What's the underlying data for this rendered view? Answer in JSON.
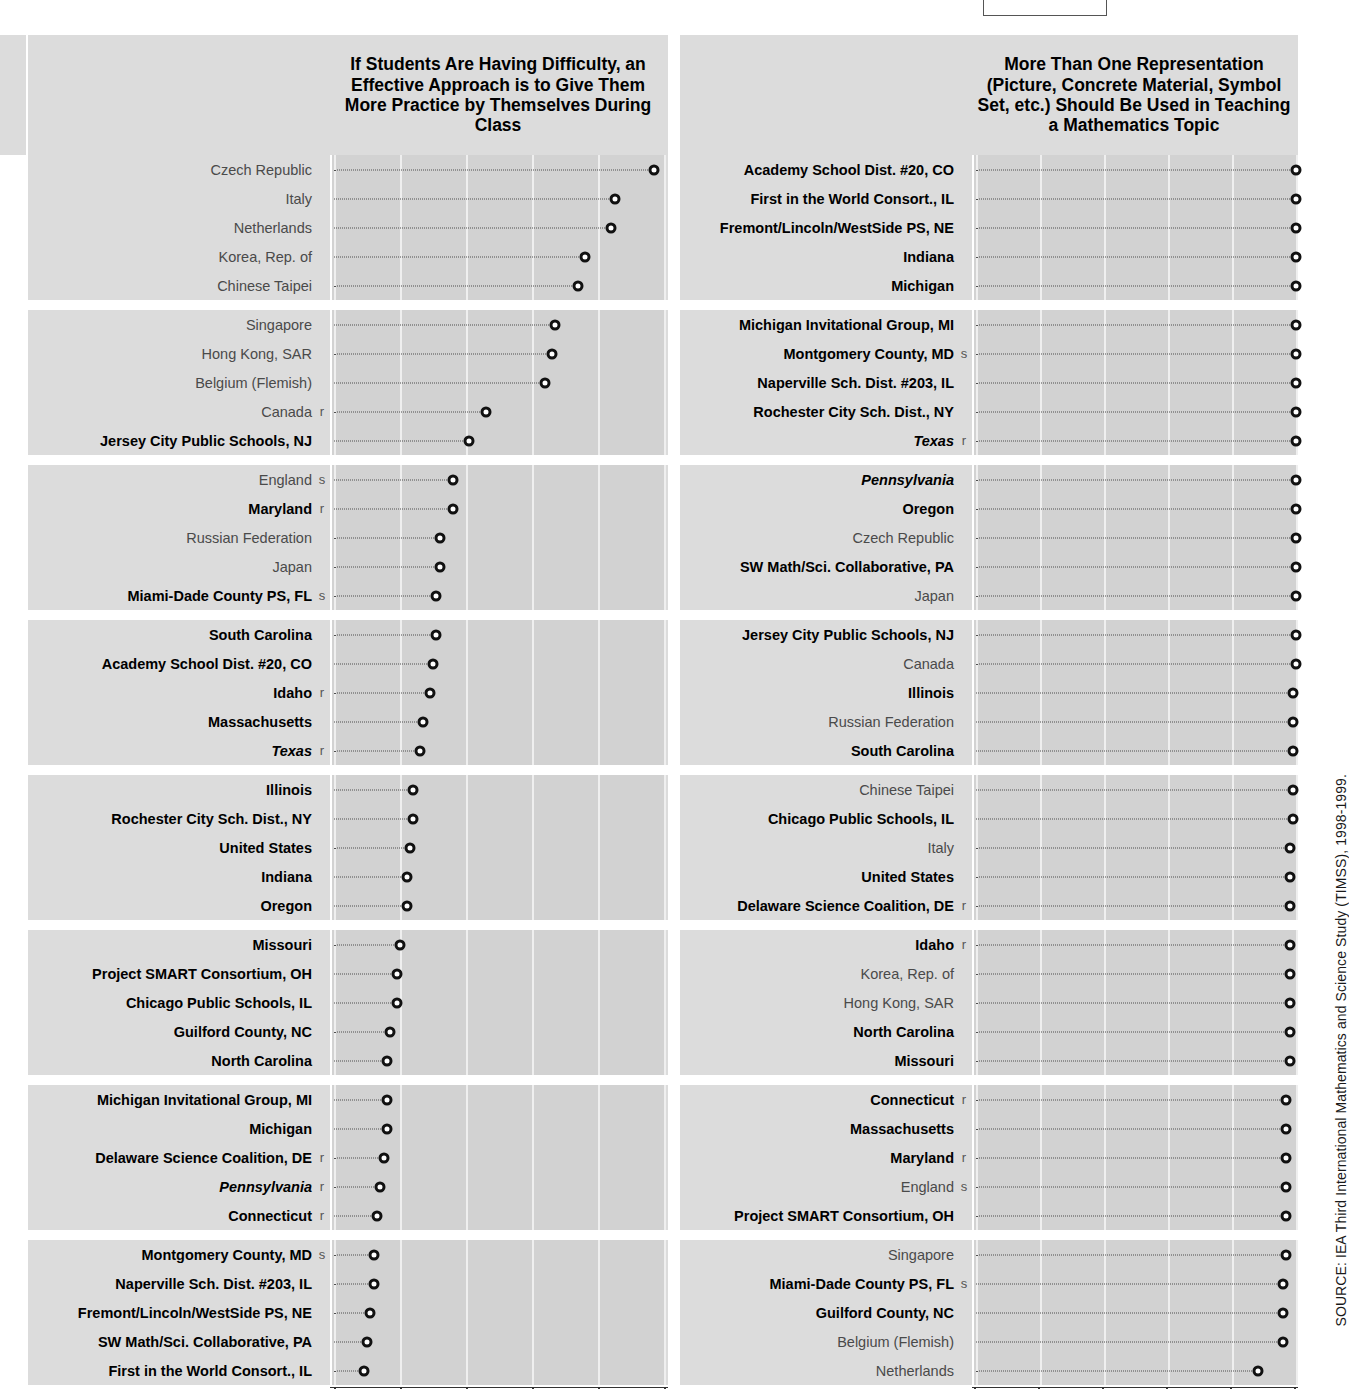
{
  "source_note": "SOURCE: IEA Third International Mathematics and Science Study (TIMSS), 1998-1999.",
  "axis": {
    "ticks": [
      "0",
      "20",
      "40",
      "60",
      "80",
      "100"
    ],
    "min": 0,
    "max": 100
  },
  "panels": [
    {
      "id": "practice-by-themselves",
      "title": "If Students Are Having Difficulty, an Effective Approach is to Give Them More Practice by Themselves During Class"
    },
    {
      "id": "more-than-one-representation",
      "title": "More Than One Representation (Picture, Concrete Material, Symbol Set, etc.) Should Be Used in Teaching a Mathematics Topic"
    }
  ],
  "chart_data": [
    {
      "type": "scatter",
      "title": "If Students Are Having Difficulty, an Effective Approach is to Give Them More Practice by Themselves During Class",
      "xlabel": "",
      "ylabel": "",
      "xlim": [
        0,
        100
      ],
      "ticks": [
        0,
        20,
        40,
        60,
        80,
        100
      ],
      "grid": true,
      "legend": "none",
      "categories": [
        "Czech Republic",
        "Italy",
        "Netherlands",
        "Korea, Rep. of",
        "Chinese Taipei",
        "Singapore",
        "Hong Kong, SAR",
        "Belgium (Flemish)",
        "Canada",
        "Jersey City Public Schools, NJ",
        "England",
        "Maryland",
        "Russian Federation",
        "Japan",
        "Miami-Dade County PS, FL",
        "South Carolina",
        "Academy School Dist. #20, CO",
        "Idaho",
        "Massachusetts",
        "Texas",
        "Illinois",
        "Rochester City Sch. Dist., NY",
        "United States",
        "Indiana",
        "Oregon",
        "Missouri",
        "Project SMART Consortium, OH",
        "Chicago Public Schools, IL",
        "Guilford County, NC",
        "North Carolina",
        "Michigan Invitational Group, MI",
        "Michigan",
        "Delaware Science Coalition, DE",
        "Pennsylvania",
        "Connecticut",
        "Montgomery County, MD",
        "Naperville Sch. Dist. #203, IL",
        "Fremont/Lincoln/WestSide PS, NE",
        "SW Math/Sci. Collaborative, PA",
        "First in the World Consort., IL"
      ],
      "values": [
        97,
        85,
        84,
        76,
        74,
        67,
        66,
        64,
        46,
        41,
        36,
        36,
        32,
        32,
        31,
        31,
        30,
        29,
        27,
        26,
        24,
        24,
        23,
        22,
        22,
        20,
        19,
        19,
        17,
        16,
        16,
        16,
        15,
        14,
        13,
        12,
        12,
        11,
        10,
        9
      ],
      "styles": [
        "plain",
        "plain",
        "plain",
        "plain",
        "plain",
        "plain",
        "plain",
        "plain",
        "plain",
        "bold",
        "plain",
        "bold",
        "plain",
        "plain",
        "bold",
        "bold",
        "bold",
        "bold",
        "bold",
        "ital",
        "bold",
        "bold",
        "bold",
        "bold",
        "bold",
        "bold",
        "bold",
        "bold",
        "bold",
        "bold",
        "bold",
        "bold",
        "bold",
        "ital",
        "bold",
        "bold",
        "bold",
        "bold",
        "bold",
        "bold"
      ],
      "flags": [
        "",
        "",
        "",
        "",
        "",
        "",
        "",
        "",
        "r",
        "",
        "s",
        "r",
        "",
        "",
        "s",
        "",
        "",
        "r",
        "",
        "r",
        "",
        "",
        "",
        "",
        "",
        "",
        "",
        "",
        "",
        "",
        "",
        "",
        "r",
        "r",
        "r",
        "s",
        "",
        "",
        "",
        ""
      ]
    },
    {
      "type": "scatter",
      "title": "More Than One Representation (Picture, Concrete Material, Symbol Set, etc.) Should Be Used in Teaching a Mathematics Topic",
      "xlabel": "",
      "ylabel": "",
      "xlim": [
        0,
        100
      ],
      "ticks": [
        0,
        20,
        40,
        60,
        80,
        100
      ],
      "grid": true,
      "legend": "none",
      "categories": [
        "Academy School Dist. #20, CO",
        "First in the World Consort., IL",
        "Fremont/Lincoln/WestSide PS, NE",
        "Indiana",
        "Michigan",
        "Michigan Invitational Group, MI",
        "Montgomery County, MD",
        "Naperville Sch. Dist. #203, IL",
        "Rochester City Sch. Dist., NY",
        "Texas",
        "Pennsylvania",
        "Oregon",
        "Czech Republic",
        "SW Math/Sci. Collaborative, PA",
        "Japan",
        "Jersey City Public Schools, NJ",
        "Canada",
        "Illinois",
        "Russian Federation",
        "South Carolina",
        "Chinese Taipei",
        "Chicago Public Schools, IL",
        "Italy",
        "United States",
        "Delaware Science Coalition, DE",
        "Idaho",
        "Korea, Rep. of",
        "Hong Kong, SAR",
        "North Carolina",
        "Missouri",
        "Connecticut",
        "Massachusetts",
        "Maryland",
        "England",
        "Project SMART Consortium, OH",
        "Singapore",
        "Miami-Dade County PS, FL",
        "Guilford County, NC",
        "Belgium (Flemish)",
        "Netherlands"
      ],
      "values": [
        100,
        100,
        100,
        100,
        100,
        100,
        100,
        100,
        100,
        100,
        100,
        100,
        100,
        100,
        100,
        100,
        100,
        99,
        99,
        99,
        99,
        99,
        98,
        98,
        98,
        98,
        98,
        98,
        98,
        98,
        97,
        97,
        97,
        97,
        97,
        97,
        96,
        96,
        96,
        88
      ],
      "styles": [
        "bold",
        "bold",
        "bold",
        "bold",
        "bold",
        "bold",
        "bold",
        "bold",
        "bold",
        "ital",
        "ital",
        "bold",
        "plain",
        "bold",
        "plain",
        "bold",
        "plain",
        "bold",
        "plain",
        "bold",
        "plain",
        "bold",
        "plain",
        "bold",
        "bold",
        "bold",
        "plain",
        "plain",
        "bold",
        "bold",
        "bold",
        "bold",
        "bold",
        "plain",
        "bold",
        "plain",
        "bold",
        "bold",
        "plain",
        "plain"
      ],
      "flags": [
        "",
        "",
        "",
        "",
        "",
        "",
        "s",
        "",
        "",
        "r",
        "",
        "",
        "",
        "",
        "",
        "",
        "",
        "",
        "",
        "",
        "",
        "",
        "",
        "",
        "r",
        "r",
        "",
        "",
        "",
        "",
        "r",
        "",
        "r",
        "s",
        "",
        "",
        "s",
        "",
        "",
        ""
      ]
    }
  ]
}
